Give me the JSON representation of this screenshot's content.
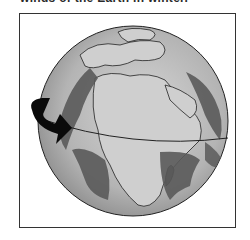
{
  "caption": {
    "text": "winds of the Earth in winter."
  },
  "figure": {
    "elements": {
      "globe": "globe",
      "equator": "equator-line",
      "arrow": "rotation-arrow",
      "wind_bands": "wind-band"
    },
    "colors": {
      "ocean": "#a8a8a8",
      "land": "#c8c8c8",
      "wind_band": "#5a5a5a",
      "arrow": "#0a0a0a",
      "outline": "#222222"
    }
  }
}
